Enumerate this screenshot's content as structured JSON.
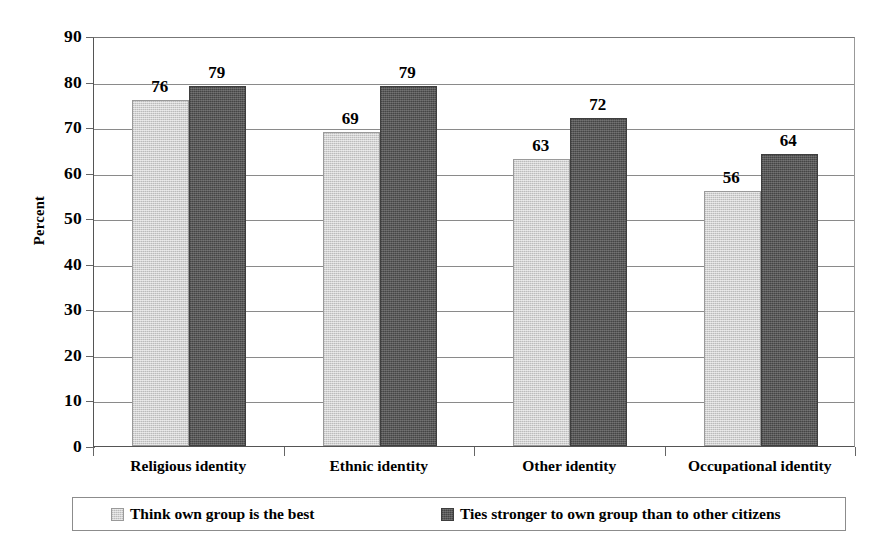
{
  "chart_data": {
    "type": "bar",
    "title": "",
    "xlabel": "",
    "ylabel": "Percent",
    "ylim": [
      0,
      90
    ],
    "ytick_step": 10,
    "yticks": [
      0,
      10,
      20,
      30,
      40,
      50,
      60,
      70,
      80,
      90
    ],
    "grid": true,
    "grid_axis": "y",
    "legend_position": "bottom",
    "categories": [
      "Religious identity",
      "Ethnic identity",
      "Other identity",
      "Occupational identity"
    ],
    "series": [
      {
        "name": "Think own group is the best",
        "color": "#d2d2d2",
        "values": [
          76,
          69,
          63,
          56
        ]
      },
      {
        "name": "Ties stronger to own group than to other citizens",
        "color": "#585858",
        "values": [
          79,
          79,
          72,
          64
        ]
      }
    ],
    "data_labels": [
      [
        "76",
        "79"
      ],
      [
        "69",
        "79"
      ],
      [
        "63",
        "72"
      ],
      [
        "56",
        "64"
      ]
    ]
  },
  "axis": {
    "y_title": "Percent",
    "y_tick_labels": [
      "90",
      "80",
      "70",
      "60",
      "50",
      "40",
      "30",
      "20",
      "10",
      "0"
    ]
  },
  "legend": {
    "entries": [
      {
        "label": "Think own group is the best",
        "swatch": "light-gray-swatch"
      },
      {
        "label": "Ties stronger to own group than to other citizens",
        "swatch": "dark-gray-swatch"
      }
    ]
  }
}
